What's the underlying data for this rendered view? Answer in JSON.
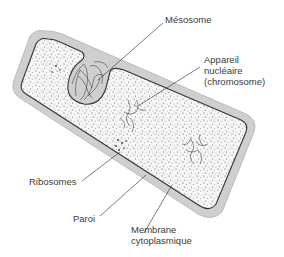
{
  "diagram": {
    "colors": {
      "wall": "#c8c8c8",
      "membrane": "#333333",
      "cytoplasm_dots": "#555555",
      "leader": "#444444",
      "text": "#3a3a3a"
    },
    "labels": {
      "mesosome": "Mésosome",
      "nucleus_1": "Appareil",
      "nucleus_2": "nucléaire",
      "nucleus_3": "(chromosome)",
      "ribosomes": "Ribosomes",
      "wall": "Paroi",
      "membrane_1": "Membrane",
      "membrane_2": "cytoplasmique"
    }
  }
}
